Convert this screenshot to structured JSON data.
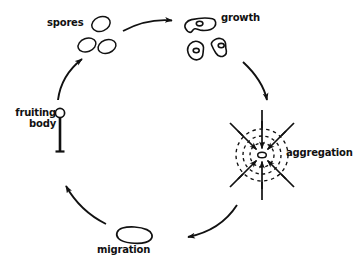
{
  "diagram": {
    "type": "cycle-diagram",
    "background_color": "#ffffff",
    "ink_color": "#111111",
    "stages": [
      {
        "id": "spores",
        "label": "spores",
        "icon": "spore-ovals-icon",
        "count": 3,
        "position": "top-left"
      },
      {
        "id": "growth",
        "label": "growth",
        "icon": "amoeba-cells-icon",
        "count": 3,
        "position": "top-right"
      },
      {
        "id": "aggregation",
        "label": "aggregation",
        "icon": "aggregation-rings-icon",
        "rings": 3,
        "inward_arrows": 8,
        "position": "right"
      },
      {
        "id": "migration",
        "label": "migration",
        "icon": "slug-icon",
        "position": "bottom"
      },
      {
        "id": "fruiting-body",
        "label_line1": "fruiting",
        "label_line2": "body",
        "icon": "fruiting-body-icon",
        "position": "left"
      }
    ],
    "transitions": [
      {
        "from": "spores",
        "to": "growth"
      },
      {
        "from": "growth",
        "to": "aggregation"
      },
      {
        "from": "aggregation",
        "to": "migration"
      },
      {
        "from": "migration",
        "to": "fruiting-body"
      },
      {
        "from": "fruiting-body",
        "to": "spores"
      }
    ]
  }
}
